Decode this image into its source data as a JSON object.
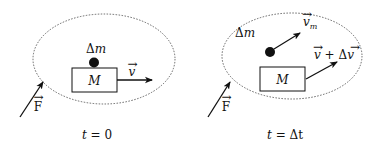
{
  "colors": {
    "ink": "#111111",
    "background": "#ffffff",
    "system_boundary": "#555555"
  },
  "panels": [
    {
      "id": "initial",
      "caption": {
        "t": "t",
        "eq": " = ",
        "value": "0"
      },
      "body": {
        "label": "M"
      },
      "particle": {
        "delta": "Δ",
        "mass": "m"
      },
      "body_velocity": {
        "symbol": "v",
        "vec": "→"
      },
      "force": {
        "symbol": "F",
        "vec": "→"
      }
    },
    {
      "id": "after",
      "caption": {
        "t": "t",
        "eq": " = ",
        "value": "Δt"
      },
      "body": {
        "label": "M"
      },
      "particle": {
        "delta": "Δ",
        "mass": "m"
      },
      "particle_velocity": {
        "symbol": "v",
        "vec": "→",
        "subscript": "m"
      },
      "body_velocity": {
        "symbol": "v",
        "vec": "→",
        "plus": " + Δ",
        "symbol2": "v"
      },
      "force": {
        "symbol": "F",
        "vec": "→"
      }
    }
  ],
  "icons": {
    "particle": "filled-circle-icon",
    "arrow": "arrow-icon",
    "system": "dotted-ellipse-icon"
  }
}
